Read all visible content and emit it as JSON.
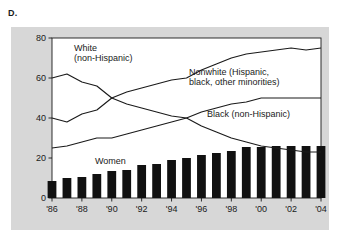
{
  "panel": {
    "letter": "D."
  },
  "chart_data": {
    "type": "line",
    "title": "",
    "xlabel": "Year",
    "ylabel": "Percent of AIDS cases",
    "xlim": [
      1986,
      2004
    ],
    "ylim": [
      0,
      80
    ],
    "yticks": [
      0,
      20,
      40,
      60,
      80
    ],
    "ytick_labels": [
      "0",
      "20",
      "40",
      "60",
      "80"
    ],
    "xticks": [
      1986,
      1988,
      1990,
      1992,
      1994,
      1996,
      1998,
      2000,
      2002,
      2004
    ],
    "xtick_labels": [
      "'86",
      "'88",
      "'90",
      "'92",
      "'94",
      "'96",
      "'98",
      "'00",
      "'02",
      "'04"
    ],
    "grid": false,
    "legend": "inline annotations",
    "x": [
      1986,
      1987,
      1988,
      1989,
      1990,
      1991,
      1992,
      1993,
      1994,
      1995,
      1996,
      1997,
      1998,
      1999,
      2000,
      2001,
      2002,
      2003,
      2004
    ],
    "series": [
      {
        "name": "White (non-Hispanic)",
        "type": "line",
        "values": [
          60,
          62,
          58,
          56,
          50,
          47,
          45,
          43,
          41,
          40,
          36,
          33,
          30,
          28,
          26,
          25,
          24,
          23,
          23
        ]
      },
      {
        "name": "Nonwhite (Hispanic, black, other minorities)",
        "type": "line",
        "values": [
          40,
          38,
          42,
          44,
          50,
          53,
          55,
          57,
          59,
          60,
          64,
          67,
          70,
          72,
          73,
          74,
          75,
          74,
          75
        ]
      },
      {
        "name": "Black (non-Hispanic)",
        "type": "line",
        "values": [
          25,
          26,
          28,
          30,
          30,
          32,
          34,
          36,
          38,
          40,
          43,
          45,
          47,
          48,
          50,
          50,
          50,
          50,
          50
        ]
      },
      {
        "name": "Women",
        "type": "bar",
        "values": [
          8.5,
          10,
          10.5,
          12,
          13.5,
          14,
          16.5,
          17,
          19,
          20,
          21.5,
          22.5,
          23.5,
          25.5,
          25.5,
          26,
          26,
          26,
          26
        ]
      }
    ],
    "annotations": [
      {
        "id": "white-label",
        "text_line1": "White",
        "text_line2": "(non-Hispanic)"
      },
      {
        "id": "nonwhite-label",
        "text_line1": "Nonwhite (Hispanic,",
        "text_line2": "black, other minorities)"
      },
      {
        "id": "black-label",
        "text_line1": "Black (non-Hispanic)",
        "text_line2": ""
      },
      {
        "id": "women-label",
        "text_line1": "Women",
        "text_line2": ""
      }
    ],
    "colors": {
      "bar": "#111111",
      "line": "#1a1a1a",
      "plot_background": "#ffffff",
      "figure_background": "#d7d7d7",
      "text": "#1a1a1a"
    }
  }
}
